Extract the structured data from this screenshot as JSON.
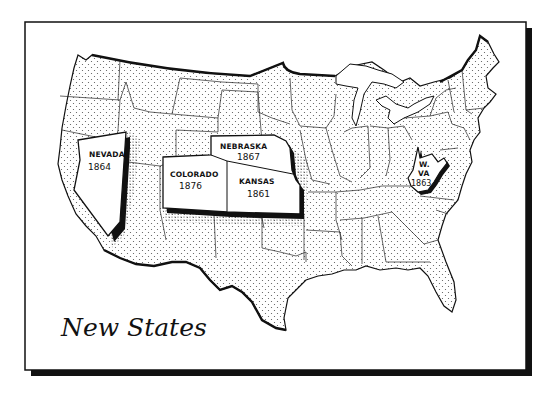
{
  "map": {
    "title": "New States",
    "subject": "United States map highlighting new states and their admission years",
    "colors": {
      "ink": "#111111",
      "paper": "#ffffff",
      "stipple": "#555555"
    },
    "highlighted_states": [
      {
        "name": "NEVADA",
        "year": "1864"
      },
      {
        "name": "NEBRASKA",
        "year": "1867"
      },
      {
        "name": "COLORADO",
        "year": "1876"
      },
      {
        "name": "KANSAS",
        "year": "1861"
      },
      {
        "name_line1": "W.",
        "name_line2": "VA",
        "year": "1863"
      }
    ]
  }
}
